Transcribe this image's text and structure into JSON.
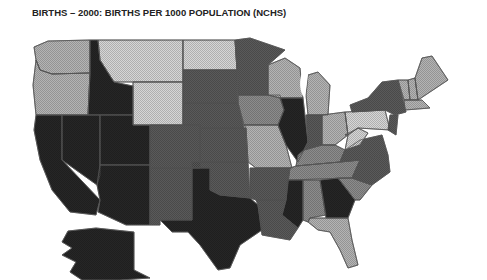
{
  "title": "BIRTHS – 2000: BIRTHS PER 1000 POPULATION (NCHS)",
  "map": {
    "type": "choropleth",
    "region": "United States",
    "shading": {
      "lightest": "#d6d6d6",
      "light": "#b4b4b4",
      "medium": "#8c8c8c",
      "dark": "#5a5a5a",
      "darkest": "#262626"
    },
    "states": [
      {
        "name": "WA",
        "shade": "light"
      },
      {
        "name": "OR",
        "shade": "light"
      },
      {
        "name": "CA",
        "shade": "darkest"
      },
      {
        "name": "ID",
        "shade": "darkest"
      },
      {
        "name": "NV",
        "shade": "darkest"
      },
      {
        "name": "UT",
        "shade": "darkest"
      },
      {
        "name": "AZ",
        "shade": "darkest"
      },
      {
        "name": "MT",
        "shade": "lightest"
      },
      {
        "name": "WY",
        "shade": "lightest"
      },
      {
        "name": "CO",
        "shade": "dark"
      },
      {
        "name": "NM",
        "shade": "dark"
      },
      {
        "name": "ND",
        "shade": "lightest"
      },
      {
        "name": "SD",
        "shade": "dark"
      },
      {
        "name": "NE",
        "shade": "dark"
      },
      {
        "name": "KS",
        "shade": "dark"
      },
      {
        "name": "OK",
        "shade": "dark"
      },
      {
        "name": "TX",
        "shade": "darkest"
      },
      {
        "name": "MN",
        "shade": "dark"
      },
      {
        "name": "IA",
        "shade": "medium"
      },
      {
        "name": "MO",
        "shade": "light"
      },
      {
        "name": "AR",
        "shade": "dark"
      },
      {
        "name": "LA",
        "shade": "dark"
      },
      {
        "name": "WI",
        "shade": "light"
      },
      {
        "name": "IL",
        "shade": "darkest"
      },
      {
        "name": "MI",
        "shade": "light"
      },
      {
        "name": "IN",
        "shade": "dark"
      },
      {
        "name": "OH",
        "shade": "light"
      },
      {
        "name": "KY",
        "shade": "medium"
      },
      {
        "name": "TN",
        "shade": "medium"
      },
      {
        "name": "MS",
        "shade": "darkest"
      },
      {
        "name": "AL",
        "shade": "medium"
      },
      {
        "name": "GA",
        "shade": "darkest"
      },
      {
        "name": "FL",
        "shade": "light"
      },
      {
        "name": "SC",
        "shade": "medium"
      },
      {
        "name": "NC",
        "shade": "dark"
      },
      {
        "name": "VA",
        "shade": "dark"
      },
      {
        "name": "WV",
        "shade": "lightest"
      },
      {
        "name": "PA",
        "shade": "lightest"
      },
      {
        "name": "NY",
        "shade": "dark"
      },
      {
        "name": "ME",
        "shade": "light"
      },
      {
        "name": "VT",
        "shade": "light"
      },
      {
        "name": "NH",
        "shade": "light"
      },
      {
        "name": "MA",
        "shade": "light"
      },
      {
        "name": "NJ",
        "shade": "dark"
      },
      {
        "name": "AK",
        "shade": "darkest"
      }
    ]
  }
}
